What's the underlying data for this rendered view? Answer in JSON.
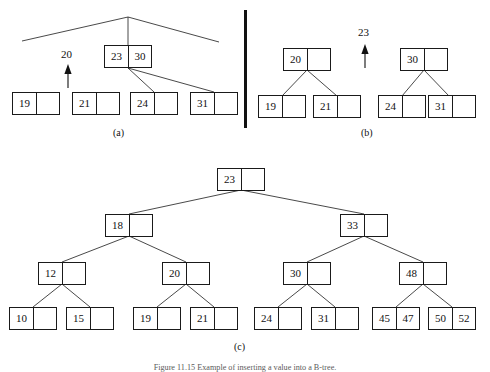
{
  "figure": {
    "caption": "Figure 11.15  Example of inserting a value into a B-tree.",
    "panel_labels": {
      "a": "(a)",
      "b": "(b)",
      "c": "(c)"
    },
    "line_color": "#1a1a1a",
    "text_color": "#111111",
    "background": "#ffffff"
  },
  "panel_a": {
    "name": "before-insertion-of-20",
    "inserted_value": "20",
    "internal_node": {
      "cells": [
        "23",
        "30"
      ]
    },
    "leaves": [
      {
        "cells": [
          "19",
          ""
        ]
      },
      {
        "cells": [
          "21",
          ""
        ]
      },
      {
        "cells": [
          "24",
          ""
        ]
      },
      {
        "cells": [
          "31",
          ""
        ]
      }
    ]
  },
  "panel_b": {
    "name": "after-split-promoting-23",
    "promoted_value": "23",
    "internal_nodes": [
      {
        "cells": [
          "20",
          ""
        ]
      },
      {
        "cells": [
          "30",
          ""
        ]
      }
    ],
    "leaves": [
      {
        "cells": [
          "19",
          ""
        ]
      },
      {
        "cells": [
          "21",
          ""
        ]
      },
      {
        "cells": [
          "24",
          ""
        ]
      },
      {
        "cells": [
          "31",
          ""
        ]
      }
    ]
  },
  "panel_c": {
    "name": "resulting-b-tree",
    "root": {
      "cells": [
        "23",
        ""
      ]
    },
    "level1": [
      {
        "cells": [
          "18",
          ""
        ]
      },
      {
        "cells": [
          "33",
          ""
        ]
      }
    ],
    "level2": [
      {
        "cells": [
          "12",
          ""
        ]
      },
      {
        "cells": [
          "20",
          ""
        ]
      },
      {
        "cells": [
          "30",
          ""
        ]
      },
      {
        "cells": [
          "48",
          ""
        ]
      }
    ],
    "leaves": [
      {
        "cells": [
          "10",
          ""
        ]
      },
      {
        "cells": [
          "15",
          ""
        ]
      },
      {
        "cells": [
          "19",
          ""
        ]
      },
      {
        "cells": [
          "21",
          ""
        ]
      },
      {
        "cells": [
          "24",
          ""
        ]
      },
      {
        "cells": [
          "31",
          ""
        ]
      },
      {
        "cells": [
          "45",
          "47"
        ]
      },
      {
        "cells": [
          "50",
          "52"
        ]
      }
    ]
  }
}
